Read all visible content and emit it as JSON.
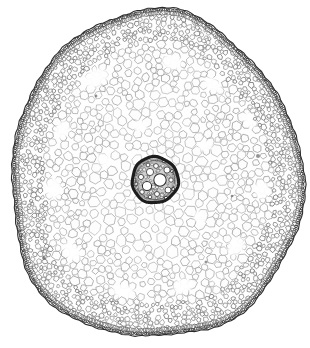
{
  "figure": {
    "kind": "light-micrograph",
    "caption_fragment": "",
    "background_color": "#ffffff",
    "ink_color": "#2b2b2b",
    "cell_wall_color": "#8c8c8c",
    "lumen_color": "#fdfdfd",
    "width_px": 310,
    "height_px": 348
  },
  "specimen": {
    "outline": {
      "center_x": 155,
      "center_y": 180,
      "radius_x": 146,
      "radius_y": 168,
      "shape": "ovoid-slightly-angular",
      "bottom_tip_y": 340
    },
    "layers": [
      {
        "name": "epidermis",
        "label": "epidermis",
        "band_thickness": 6,
        "cell_size": 3.1,
        "tone": "#2f2f2f",
        "density": 1.0
      },
      {
        "name": "outer-cortex",
        "label": "outer cortex",
        "band_thickness": 26,
        "cell_size": 5.0,
        "tone": "#6a6a6a",
        "density": 0.92
      },
      {
        "name": "mid-cortex",
        "label": "mid cortex",
        "band_thickness": 48,
        "cell_size": 8.5,
        "tone": "#8a8a8a",
        "density": 0.8
      },
      {
        "name": "inner-cortex",
        "label": "inner cortex parenchyma",
        "band_thickness": 64,
        "cell_size": 11.0,
        "tone": "#979797",
        "density": 0.72
      }
    ],
    "stele": {
      "label": "stele",
      "center_x": 155,
      "center_y": 180,
      "outer_radius": 23,
      "endodermis_color": "#1d1d1d",
      "endodermis_thickness": 3.2,
      "pericycle_tone": "#5b5b5b",
      "vessel_color": "#ffffff",
      "vessel_outline": "#2a2a2a",
      "vessels": [
        {
          "cx": 160,
          "cy": 180,
          "r": 6.2
        },
        {
          "cx": 147,
          "cy": 186,
          "r": 4.6
        },
        {
          "cx": 150,
          "cy": 172,
          "r": 3.6
        },
        {
          "cx": 167,
          "cy": 170,
          "r": 3.1
        },
        {
          "cx": 168,
          "cy": 190,
          "r": 3.0
        },
        {
          "cx": 141,
          "cy": 177,
          "r": 2.6
        },
        {
          "cx": 156,
          "cy": 166,
          "r": 2.4
        },
        {
          "cx": 142,
          "cy": 192,
          "r": 2.3
        },
        {
          "cx": 157,
          "cy": 194,
          "r": 2.5
        },
        {
          "cx": 171,
          "cy": 180,
          "r": 2.2
        },
        {
          "cx": 148,
          "cy": 165,
          "r": 1.9
        },
        {
          "cx": 164,
          "cy": 161,
          "r": 1.8
        },
        {
          "cx": 136,
          "cy": 184,
          "r": 1.9
        },
        {
          "cx": 150,
          "cy": 197,
          "r": 1.8
        },
        {
          "cx": 166,
          "cy": 198,
          "r": 1.7
        },
        {
          "cx": 173,
          "cy": 189,
          "r": 1.6
        },
        {
          "cx": 172,
          "cy": 171,
          "r": 1.6
        }
      ]
    },
    "lacunae": [
      {
        "cx": 96,
        "cy": 78,
        "rx": 16,
        "ry": 11,
        "rot": -28
      },
      {
        "cx": 172,
        "cy": 62,
        "rx": 13,
        "ry": 9,
        "rot": 14
      },
      {
        "cx": 213,
        "cy": 85,
        "rx": 12,
        "ry": 8,
        "rot": 38
      },
      {
        "cx": 250,
        "cy": 120,
        "rx": 11,
        "ry": 8,
        "rot": 62
      },
      {
        "cx": 62,
        "cy": 130,
        "rx": 12,
        "ry": 9,
        "rot": -62
      },
      {
        "cx": 54,
        "cy": 188,
        "rx": 13,
        "ry": 10,
        "rot": 82
      },
      {
        "cx": 72,
        "cy": 252,
        "rx": 13,
        "ry": 9,
        "rot": 48
      },
      {
        "cx": 124,
        "cy": 292,
        "rx": 14,
        "ry": 10,
        "rot": 16
      },
      {
        "cx": 183,
        "cy": 286,
        "rx": 12,
        "ry": 9,
        "rot": -22
      },
      {
        "cx": 236,
        "cy": 246,
        "rx": 12,
        "ry": 9,
        "rot": -52
      },
      {
        "cx": 262,
        "cy": 190,
        "rx": 11,
        "ry": 9,
        "rot": -84
      },
      {
        "cx": 140,
        "cy": 126,
        "rx": 9,
        "ry": 7,
        "rot": 10
      },
      {
        "cx": 206,
        "cy": 146,
        "rx": 9,
        "ry": 6,
        "rot": -18
      },
      {
        "cx": 104,
        "cy": 160,
        "rx": 9,
        "ry": 7,
        "rot": 30
      },
      {
        "cx": 200,
        "cy": 218,
        "rx": 9,
        "ry": 7,
        "rot": 58
      }
    ],
    "specks": [
      {
        "cx": 258,
        "cy": 156,
        "r": 2.0
      },
      {
        "cx": 44,
        "cy": 258,
        "r": 1.9
      },
      {
        "cx": 206,
        "cy": 262,
        "r": 1.5
      },
      {
        "cx": 96,
        "cy": 96,
        "r": 1.4
      },
      {
        "cx": 232,
        "cy": 196,
        "r": 1.3
      }
    ]
  },
  "render": {
    "seed": 20240617,
    "cell_count_target": 2400,
    "stroke_min": 0.45,
    "stroke_max": 0.9
  }
}
